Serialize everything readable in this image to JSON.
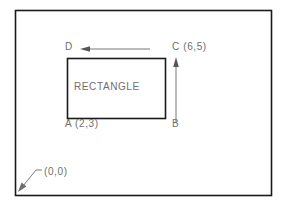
{
  "figure": {
    "type": "geometry-diagram",
    "colors": {
      "border": "#1a1a1a",
      "shape_outline": "#1a1a1a",
      "text": "#6e6e6e",
      "arrow": "#555555",
      "background": "#ffffff"
    },
    "frame": {
      "name": "outer-border",
      "x": 15,
      "y": 10,
      "width": 257,
      "height": 186
    },
    "rectangle": {
      "name": "rectangle-shape",
      "label": "RECTANGLE",
      "x": 67,
      "y": 58,
      "width": 99,
      "height": 61
    },
    "vertices": [
      {
        "id": "A",
        "label": "A (2,3)",
        "coords": "(2,3)",
        "position": "bottom-left"
      },
      {
        "id": "B",
        "label": "B",
        "coords": "",
        "position": "bottom-right"
      },
      {
        "id": "C",
        "label": "C (6,5)",
        "coords": "(6,5)",
        "position": "top-right"
      },
      {
        "id": "D",
        "label": "D",
        "coords": "",
        "position": "top-left"
      }
    ],
    "origin": {
      "label": "(0,0)",
      "leader_from": "bottom-left-corner"
    },
    "arrows": [
      {
        "name": "horizontal-width-arrow",
        "direction": "left",
        "from_x": 150,
        "to_x": 83,
        "y": 49
      },
      {
        "name": "vertical-height-arrow",
        "direction": "up",
        "x": 176,
        "from_y": 122,
        "to_y": 58
      }
    ]
  }
}
